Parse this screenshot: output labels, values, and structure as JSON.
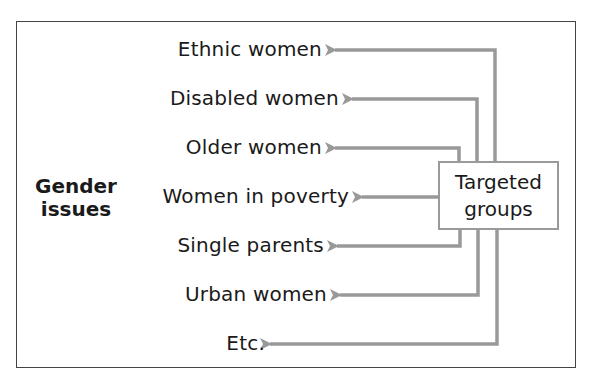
{
  "diagram": {
    "source_label": "Gender issues",
    "source_label_lines": [
      "Gender",
      "issues"
    ],
    "hub_label_lines": [
      "Targeted",
      "groups"
    ],
    "groups": [
      {
        "label": "Ethnic women"
      },
      {
        "label": "Disabled women"
      },
      {
        "label": "Older women"
      },
      {
        "label": "Women in poverty"
      },
      {
        "label": "Single parents"
      },
      {
        "label": "Urban women"
      },
      {
        "label": "Etc."
      }
    ],
    "colors": {
      "arrow": "#999999",
      "frame": "#444444",
      "text": "#1a1a1a"
    }
  }
}
